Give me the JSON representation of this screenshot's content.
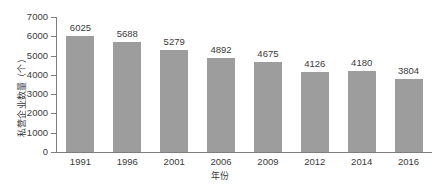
{
  "chart_data": {
    "type": "bar",
    "title": "",
    "subtitle": "",
    "xlabel": "年份",
    "ylabel": "私营企业数量（个）",
    "categories": [
      "1991",
      "1996",
      "2001",
      "2006",
      "2009",
      "2012",
      "2014",
      "2016"
    ],
    "values": [
      6025,
      5688,
      5279,
      4892,
      4675,
      4126,
      4180,
      3804
    ],
    "series": [
      {
        "name": "私营企业数量",
        "values": [
          6025,
          5688,
          5279,
          4892,
          4675,
          4126,
          4180,
          3804
        ]
      }
    ],
    "data_labels": [
      "6025",
      "5688",
      "5279",
      "4892",
      "4675",
      "4126",
      "4180",
      "3804"
    ],
    "ylim": [
      0,
      7000
    ],
    "ytick_values": [
      0,
      1000,
      2000,
      3000,
      4000,
      5000,
      6000,
      7000
    ],
    "ytick_labels": [
      "0",
      "1000",
      "2000",
      "3000",
      "4000",
      "5000",
      "6000",
      "7000"
    ],
    "grid": false,
    "legend": null,
    "legend_position": "none",
    "bar_color": "#9d9d9d",
    "axis_color": "#7d7d7d",
    "text_color": "#3a3a3a",
    "background": "#ffffff"
  }
}
